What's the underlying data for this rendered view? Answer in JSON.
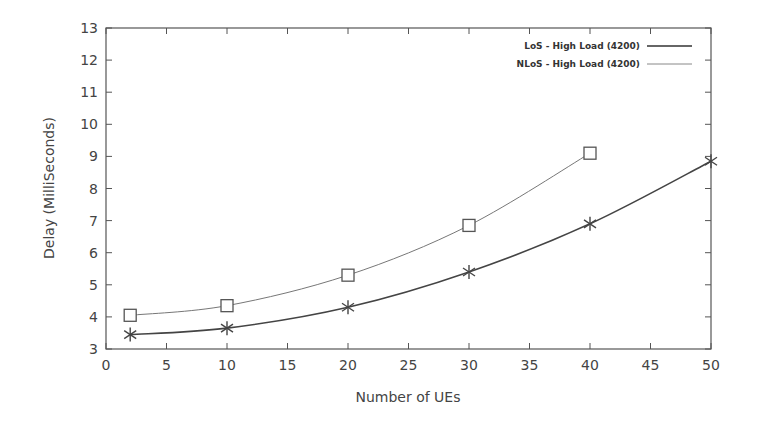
{
  "chart_data": {
    "type": "line",
    "title": "",
    "xlabel": "Number of UEs",
    "ylabel": "Delay (MilliSeconds)",
    "xlim": [
      0,
      50
    ],
    "ylim": [
      3,
      13
    ],
    "xticks": [
      0,
      5,
      10,
      15,
      20,
      25,
      30,
      35,
      40,
      45,
      50
    ],
    "yticks": [
      3,
      4,
      5,
      6,
      7,
      8,
      9,
      10,
      11,
      12,
      13
    ],
    "grid": false,
    "legend_position": "top-right",
    "series": [
      {
        "name": "LoS - High Load (4200)",
        "marker": "asterisk",
        "line": "thick",
        "x": [
          2,
          10,
          20,
          30,
          40,
          50
        ],
        "values": [
          3.45,
          3.65,
          4.3,
          5.4,
          6.9,
          8.85
        ]
      },
      {
        "name": "NLoS - High Load (4200)",
        "marker": "square",
        "line": "thin",
        "x": [
          2,
          10,
          20,
          30,
          40
        ],
        "values": [
          4.05,
          4.35,
          5.3,
          6.85,
          9.1
        ]
      }
    ]
  }
}
